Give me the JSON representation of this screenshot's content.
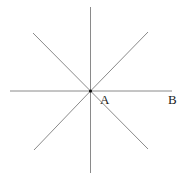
{
  "diagram": {
    "center": {
      "x": 90.5,
      "y": 91
    },
    "rays": [
      {
        "name": "north",
        "x2": 90.5,
        "y2": 7
      },
      {
        "name": "south",
        "x2": 90.5,
        "y2": 173
      },
      {
        "name": "west",
        "x2": 10,
        "y2": 91
      },
      {
        "name": "east",
        "x2": 172,
        "y2": 91
      },
      {
        "name": "northwest",
        "x2": 33,
        "y2": 33
      },
      {
        "name": "northeast",
        "x2": 148,
        "y2": 32
      },
      {
        "name": "southwest",
        "x2": 34,
        "y2": 150
      },
      {
        "name": "southeast",
        "x2": 148,
        "y2": 149
      }
    ],
    "labels": {
      "point_a": "A",
      "point_b": "B"
    },
    "colors": {
      "line": "#8a8a8a",
      "text": "#222222",
      "background": "#ffffff"
    }
  }
}
